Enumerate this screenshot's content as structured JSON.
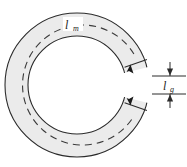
{
  "figure": {
    "background_color": "#ffffff"
  },
  "core": {
    "name": "c-shaped-magnetic-core",
    "fill_color": "#ebebeb",
    "outline_color": "#2b2b2b",
    "shape": "annulus-with-gap",
    "center_x": 77,
    "center_y": 85,
    "outer_radius": 72,
    "inner_radius": 49,
    "gap_top_angle_deg": -14,
    "gap_bottom_angle_deg": 14
  },
  "mean_path": {
    "name": "mean-magnetic-path",
    "style": "dashed",
    "color": "#3a3a3a",
    "radius": 60,
    "label": "l",
    "subscript": "m",
    "label_full": "lm",
    "label_x": 70,
    "label_y": 27
  },
  "air_gap": {
    "name": "air-gap-dimension",
    "label": "l",
    "subscript": "g",
    "label_full": "lg",
    "label_x": 166,
    "label_y": 90,
    "dimension_line_x": 170,
    "top_y": 76,
    "bottom_y": 94,
    "extension_line_start_x": 152,
    "extension_line_end_x": 186,
    "arrow_color": "#2b2b2b"
  },
  "flux_arrows": {
    "name": "flux-direction-arrows",
    "color": "#1a1a1a",
    "count": 2,
    "positions": [
      {
        "x": 130,
        "y": 71
      },
      {
        "x": 130,
        "y": 99
      }
    ]
  }
}
